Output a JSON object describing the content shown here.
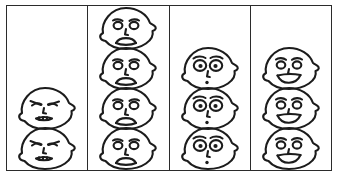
{
  "figure": {
    "title": "",
    "frame_color": "#2b2b2b",
    "ink_color": "#1c1c1c",
    "background": "#ffffff"
  },
  "chart_data": {
    "type": "bar",
    "title": "",
    "xlabel": "",
    "ylabel": "",
    "grid": false,
    "legend": "none",
    "ylim": [
      0,
      4
    ],
    "unit": "face icon",
    "categories": [
      "angry",
      "sad",
      "surprised",
      "happy"
    ],
    "values": [
      2,
      4,
      3,
      3
    ],
    "columns": [
      {
        "index": 1,
        "name": "angry",
        "icon": "angry-face-icon",
        "count": 2,
        "stacked_from": "bottom"
      },
      {
        "index": 2,
        "name": "sad",
        "icon": "sad-face-icon",
        "count": 4,
        "stacked_from": "bottom"
      },
      {
        "index": 3,
        "name": "surprised",
        "icon": "surprised-face-icon",
        "count": 3,
        "stacked_from": "bottom"
      },
      {
        "index": 4,
        "name": "happy",
        "icon": "happy-face-icon",
        "count": 3,
        "stacked_from": "bottom"
      }
    ]
  }
}
